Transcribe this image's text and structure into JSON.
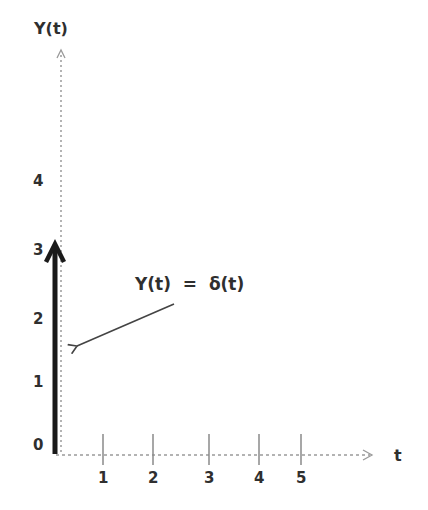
{
  "diagram": {
    "y_axis": {
      "label": "Y(t)",
      "ticks": [
        "0",
        "1",
        "2",
        "3",
        "4"
      ],
      "style": "dotted",
      "color": "#9a9a9a"
    },
    "t_axis": {
      "label": "t",
      "ticks": [
        "1",
        "2",
        "3",
        "4",
        "5"
      ],
      "style": "dotted",
      "color": "#9a9a9a"
    },
    "impulse": {
      "at_t": 0,
      "height": 3,
      "color": "#1a1a1a"
    },
    "annotation": {
      "text": "Y(t)  =  δ(t)",
      "points_to": "impulse",
      "arrow_color": "#444444"
    }
  }
}
